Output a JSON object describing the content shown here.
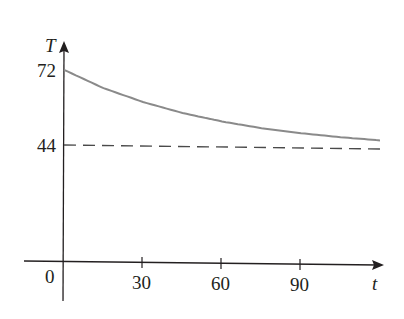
{
  "chart_data": {
    "type": "line",
    "title": "",
    "xlabel": "t",
    "ylabel": "T",
    "xlim": [
      -7,
      122
    ],
    "ylim": [
      0,
      80
    ],
    "grid": false,
    "legend": null,
    "x_ticks": [
      0,
      30,
      60,
      90
    ],
    "x_tick_labels": [
      "0",
      "30",
      "60",
      "90"
    ],
    "y_ticks": [
      72,
      44
    ],
    "y_tick_labels": [
      "72",
      "44"
    ],
    "series": [
      {
        "name": "temperature",
        "style": "solid",
        "color": "#8a8a8a",
        "x": [
          0,
          15,
          30,
          45,
          60,
          75,
          90,
          105,
          120
        ],
        "values": [
          72,
          65.4,
          60.4,
          56.5,
          53.5,
          51.2,
          49.5,
          48.2,
          47.2
        ]
      },
      {
        "name": "asymptote",
        "style": "dashed",
        "color": "#4a4a4a",
        "x": [
          0,
          120
        ],
        "values": [
          44,
          44
        ]
      }
    ],
    "annotations": []
  },
  "labels": {
    "origin": "0",
    "t30": "30",
    "t60": "60",
    "t90": "90",
    "y72": "72",
    "y44": "44",
    "x_axis_var": "t",
    "y_axis_var": "T"
  }
}
